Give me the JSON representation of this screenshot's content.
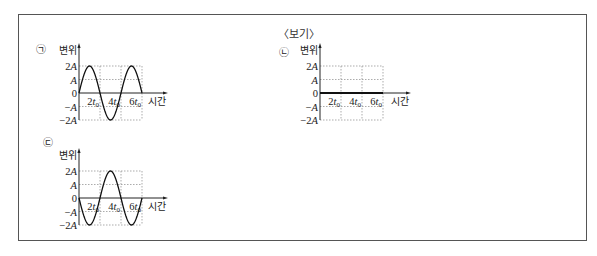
{
  "box": {
    "title": "〈보기〉"
  },
  "graphs": [
    {
      "id": "a",
      "marker": "㉠",
      "ylabel": "변위",
      "xlabel": "시간",
      "yticks": [
        "2A",
        "A",
        "0",
        "−A",
        "−2A"
      ],
      "xticks": [
        "2t₀",
        "4t₀",
        "6t₀"
      ],
      "origin": [
        79,
        93
      ],
      "t0_px": 10.5,
      "a_px": 13.5,
      "marker_pos": [
        41,
        53
      ],
      "arrow_x": 165,
      "curve": "sine",
      "phase": 1
    },
    {
      "id": "b",
      "marker": "㉡",
      "ylabel": "변위",
      "xlabel": "시간",
      "yticks": [
        "2A",
        "A",
        "0",
        "−A",
        "−2A"
      ],
      "xticks": [
        "2t₀",
        "4t₀",
        "6t₀"
      ],
      "origin": [
        320,
        93
      ],
      "t0_px": 10.5,
      "a_px": 13.5,
      "marker_pos": [
        284,
        56
      ],
      "arrow_x": 408,
      "curve": "flat",
      "phase": 0
    },
    {
      "id": "c",
      "marker": "㉢",
      "ylabel": "변위",
      "xlabel": "시간",
      "yticks": [
        "2A",
        "A",
        "0",
        "−A",
        "−2A"
      ],
      "xticks": [
        "2t₀",
        "4t₀",
        "6t₀"
      ],
      "origin": [
        79,
        198
      ],
      "t0_px": 10.5,
      "a_px": 13.5,
      "marker_pos": [
        48,
        146
      ],
      "arrow_x": 165,
      "curve": "sine",
      "phase": -1
    }
  ],
  "chart_data": [
    {
      "type": "line",
      "title": "㉠",
      "xlabel": "시간",
      "ylabel": "변위",
      "x_ticks": [
        "2t₀",
        "4t₀",
        "6t₀"
      ],
      "y_ticks": [
        "2A",
        "A",
        "0",
        "−A",
        "−2A"
      ],
      "x": [
        0,
        1,
        2,
        3,
        4,
        5,
        6
      ],
      "x_unit": "t₀",
      "values": [
        0,
        2,
        0,
        -2,
        0,
        2,
        0
      ],
      "y_unit": "A",
      "xlim": [
        0,
        6
      ],
      "ylim": [
        -2,
        2
      ],
      "grid": true
    },
    {
      "type": "line",
      "title": "㉡",
      "xlabel": "시간",
      "ylabel": "변위",
      "x_ticks": [
        "2t₀",
        "4t₀",
        "6t₀"
      ],
      "y_ticks": [
        "2A",
        "A",
        "0",
        "−A",
        "−2A"
      ],
      "x": [
        0,
        6
      ],
      "x_unit": "t₀",
      "values": [
        0,
        0
      ],
      "y_unit": "A",
      "xlim": [
        0,
        6
      ],
      "ylim": [
        -2,
        2
      ],
      "grid": true
    },
    {
      "type": "line",
      "title": "㉢",
      "xlabel": "시간",
      "ylabel": "변위",
      "x_ticks": [
        "2t₀",
        "4t₀",
        "6t₀"
      ],
      "y_ticks": [
        "2A",
        "A",
        "0",
        "−A",
        "−2A"
      ],
      "x": [
        0,
        1,
        2,
        3,
        4,
        5,
        6
      ],
      "x_unit": "t₀",
      "values": [
        0,
        -2,
        0,
        2,
        0,
        -2,
        0
      ],
      "y_unit": "A",
      "xlim": [
        0,
        6
      ],
      "ylim": [
        -2,
        2
      ],
      "grid": true
    }
  ]
}
